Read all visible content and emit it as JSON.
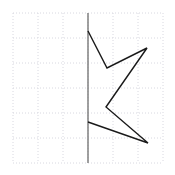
{
  "figure": {
    "title": "",
    "width": 175,
    "height": 175,
    "background_color": "#ffffff"
  },
  "grid": {
    "visible": true,
    "style": "dotted",
    "color": "#d8d8e0",
    "line_width": 1,
    "x_min": 13,
    "x_max": 163,
    "y_min": 13,
    "y_max": 163,
    "cell_size": 25,
    "columns": 6,
    "rows": 6,
    "x_lines": [
      13,
      38,
      63,
      88,
      113,
      138,
      163
    ],
    "y_lines": [
      13,
      38,
      63,
      88,
      113,
      138,
      163
    ]
  },
  "axis_line": {
    "name": "mirror-axis",
    "orientation": "vertical",
    "color": "#808080",
    "line_width": 1.5,
    "x": 88,
    "y_start": 13,
    "y_end": 163
  },
  "shape": {
    "name": "half-star-polyline",
    "type": "polyline",
    "stroke_color": "#1a1a1a",
    "stroke_width": 1.4,
    "fill": "none",
    "closed": false,
    "vertex_count": 6,
    "vertices": [
      {
        "x": 88,
        "y": 31
      },
      {
        "x": 107,
        "y": 68
      },
      {
        "x": 147,
        "y": 48
      },
      {
        "x": 106,
        "y": 107
      },
      {
        "x": 148,
        "y": 143
      },
      {
        "x": 88,
        "y": 122
      }
    ],
    "points_attr": "88,31 107,68 147,48 106,107 148,143 88,122"
  }
}
